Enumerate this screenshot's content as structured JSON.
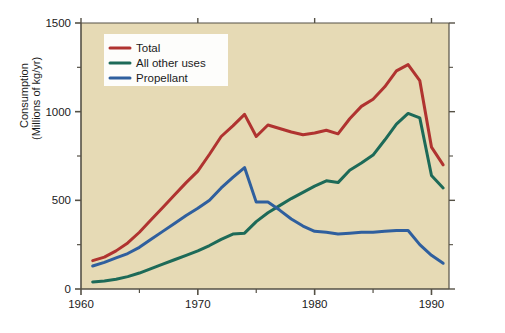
{
  "chart_data": {
    "type": "line",
    "title": "",
    "subtitle": "",
    "xlabel": "",
    "ylabel": "Consumption\n(Millions of kg/yr)",
    "ylabel_line1": "Consumption",
    "ylabel_line2": "(Millions of kg/yr)",
    "xlim": [
      1960,
      1991.5
    ],
    "ylim": [
      0,
      1500
    ],
    "grid": false,
    "legend_position": "top-left",
    "x_major_ticks": [
      1960,
      1970,
      1980,
      1990
    ],
    "x_major_tick_labels": [
      "1960",
      "1970",
      "1980",
      "1990"
    ],
    "x_minor_ticks": [
      1965,
      1975,
      1985
    ],
    "y_major_ticks": [
      0,
      500,
      1000,
      1500
    ],
    "y_major_tick_labels": [
      "0",
      "500",
      "1000",
      "1500"
    ],
    "y_minor_ticks": [
      250,
      750,
      1250
    ],
    "x": [
      1961,
      1962,
      1963,
      1964,
      1965,
      1966,
      1967,
      1968,
      1969,
      1970,
      1971,
      1972,
      1973,
      1974,
      1975,
      1976,
      1977,
      1978,
      1979,
      1980,
      1981,
      1982,
      1983,
      1984,
      1985,
      1986,
      1987,
      1988,
      1989,
      1990,
      1991
    ],
    "series": [
      {
        "name": "Total",
        "color": "#b03330",
        "values": [
          160,
          180,
          215,
          260,
          320,
          390,
          460,
          530,
          600,
          665,
          760,
          860,
          920,
          985,
          860,
          925,
          905,
          885,
          870,
          880,
          895,
          875,
          960,
          1030,
          1070,
          1140,
          1230,
          1265,
          1175,
          800,
          700
        ]
      },
      {
        "name": "All other uses",
        "color": "#1d6a58",
        "values": [
          40,
          45,
          55,
          70,
          90,
          115,
          140,
          165,
          190,
          215,
          245,
          280,
          310,
          315,
          380,
          430,
          470,
          510,
          545,
          580,
          610,
          600,
          670,
          710,
          755,
          840,
          930,
          990,
          965,
          640,
          570
        ]
      },
      {
        "name": "Propellant",
        "color": "#2f5f9e",
        "values": [
          130,
          150,
          175,
          200,
          235,
          280,
          325,
          370,
          415,
          455,
          500,
          570,
          630,
          685,
          490,
          490,
          445,
          395,
          355,
          325,
          320,
          310,
          315,
          320,
          320,
          325,
          330,
          330,
          250,
          190,
          145
        ]
      }
    ],
    "legend_entries": [
      {
        "label": "Total",
        "color": "#b03330"
      },
      {
        "label": "All other uses",
        "color": "#1d6a58"
      },
      {
        "label": "Propellant",
        "color": "#2f5f9e"
      }
    ],
    "plot_background_color": "#e6dab5",
    "figure_background_color": "#ffffff",
    "axis_color": "#555146"
  }
}
